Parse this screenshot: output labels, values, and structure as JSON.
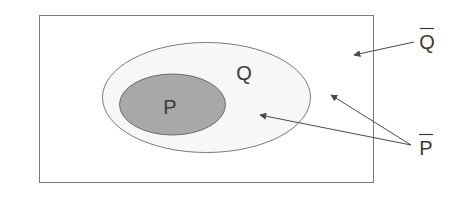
{
  "diagram": {
    "type": "venn",
    "universe": {
      "label": ""
    },
    "sets": [
      {
        "id": "Q",
        "label": "Q",
        "fill": "#f7f7f7"
      },
      {
        "id": "P",
        "label": "P",
        "fill": "#a8a8a8"
      }
    ],
    "annotations": [
      {
        "id": "q-complement",
        "label": "Q",
        "overline": true,
        "points_to": [
          "outside Q"
        ]
      },
      {
        "id": "p-complement",
        "label": "P",
        "overline": true,
        "points_to": [
          "inside Q outside P",
          "outside Q"
        ]
      }
    ],
    "colors": {
      "stroke": "#7a7a7a",
      "text": "#3a3a3a",
      "p_fill": "#a8a8a8",
      "q_fill": "#f7f7f7"
    }
  }
}
